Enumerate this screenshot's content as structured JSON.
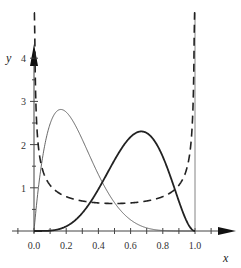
{
  "chart_data": {
    "type": "line",
    "title": "",
    "xlabel": "x",
    "ylabel": "y",
    "xlim": [
      0,
      1
    ],
    "ylim": [
      0,
      4
    ],
    "grid": false,
    "legend": "none",
    "x_ticks": [
      0.0,
      0.2,
      0.4,
      0.6,
      0.8,
      1.0
    ],
    "x_tick_labels": [
      "0.0",
      "0.2",
      "0.4",
      "0.6",
      "0.8",
      "1.0"
    ],
    "y_ticks": [
      1,
      2,
      3,
      4
    ],
    "y_tick_labels": [
      "1",
      "2",
      "3",
      "4"
    ],
    "series": [
      {
        "name": "Beta(2,6) density",
        "style": "thin-solid",
        "alpha": 2,
        "beta": 6,
        "peak": {
          "x": 0.167,
          "y": 2.8
        },
        "color": "#555555"
      },
      {
        "name": "Beta(5,3) density",
        "style": "thick-solid",
        "alpha": 5,
        "beta": 3,
        "peak": {
          "x": 0.667,
          "y": 2.3
        },
        "color": "#222222"
      },
      {
        "name": "Beta(0.5,0.5) density",
        "style": "dashed",
        "alpha": 0.5,
        "beta": 0.5,
        "minimum": {
          "x": 0.5,
          "y": 0.64
        },
        "color": "#222222"
      }
    ],
    "reference_lines": [
      {
        "x": 1.0,
        "style": "thin-vertical"
      }
    ]
  }
}
